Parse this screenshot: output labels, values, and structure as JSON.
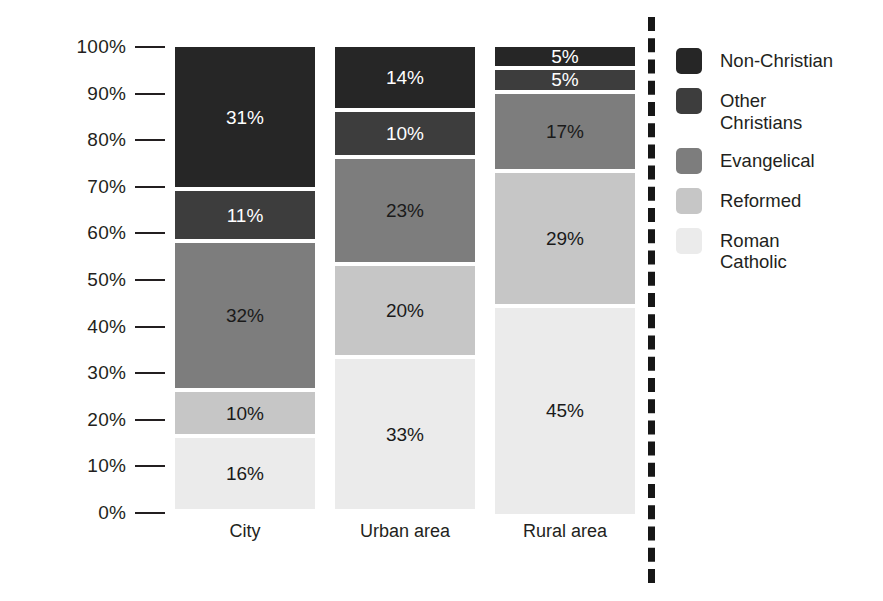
{
  "chart_data": {
    "type": "bar",
    "subtype": "stacked-percentage",
    "title": "",
    "xlabel": "",
    "ylabel": "",
    "ylim": [
      0,
      100
    ],
    "grid": false,
    "legend_position": "right",
    "categories": [
      "City",
      "Urban area",
      "Rural area"
    ],
    "y_ticks": [
      "0%",
      "10%",
      "20%",
      "30%",
      "40%",
      "50%",
      "60%",
      "70%",
      "80%",
      "90%",
      "100%"
    ],
    "series": [
      {
        "name": "Non-Christian",
        "color": "#262626",
        "label_color": "#ffffff",
        "values": [
          31,
          14,
          5
        ]
      },
      {
        "name": "Other\nChristians",
        "legend_name": "Other Christians",
        "color": "#3d3d3d",
        "label_color": "#ffffff",
        "values": [
          11,
          10,
          5
        ]
      },
      {
        "name": "Evangelical",
        "color": "#7d7d7d",
        "label_color": "#1a1a1a",
        "values": [
          32,
          23,
          17
        ]
      },
      {
        "name": "Reformed",
        "color": "#c6c6c6",
        "label_color": "#1a1a1a",
        "values": [
          10,
          20,
          29
        ]
      },
      {
        "name": "Roman\nCatholic",
        "legend_name": "Roman Catholic",
        "color": "#ebebeb",
        "label_color": "#1a1a1a",
        "values": [
          16,
          33,
          45
        ]
      }
    ],
    "bars": [
      {
        "category": "City",
        "segments": [
          {
            "series": "Non-Christian",
            "value": 31,
            "label": "31%"
          },
          {
            "series": "Other Christians",
            "value": 11,
            "label": "11%"
          },
          {
            "series": "Evangelical",
            "value": 32,
            "label": "32%"
          },
          {
            "series": "Reformed",
            "value": 10,
            "label": "10%"
          },
          {
            "series": "Roman Catholic",
            "value": 16,
            "label": "16%"
          }
        ]
      },
      {
        "category": "Urban area",
        "segments": [
          {
            "series": "Non-Christian",
            "value": 14,
            "label": "14%"
          },
          {
            "series": "Other Christians",
            "value": 10,
            "label": "10%"
          },
          {
            "series": "Evangelical",
            "value": 23,
            "label": "23%"
          },
          {
            "series": "Reformed",
            "value": 20,
            "label": "20%"
          },
          {
            "series": "Roman Catholic",
            "value": 33,
            "label": "33%"
          }
        ]
      },
      {
        "category": "Rural area",
        "segments": [
          {
            "series": "Non-Christian",
            "value": 5,
            "label": "5%"
          },
          {
            "series": "Other Christians",
            "value": 5,
            "label": "5%"
          },
          {
            "series": "Evangelical",
            "value": 17,
            "label": "17%"
          },
          {
            "series": "Reformed",
            "value": 29,
            "label": "29%"
          },
          {
            "series": "Roman Catholic",
            "value": 45,
            "label": "45%"
          }
        ]
      }
    ]
  },
  "legend": {
    "items": [
      {
        "label": "Non-Christian",
        "color": "#262626"
      },
      {
        "label": "Other\nChristians",
        "color": "#3d3d3d"
      },
      {
        "label": "Evangelical",
        "color": "#7d7d7d"
      },
      {
        "label": "Reformed",
        "color": "#c6c6c6"
      },
      {
        "label": "Roman\nCatholic",
        "color": "#ebebeb"
      }
    ]
  },
  "divider": {
    "style": "dashed",
    "color": "#171717"
  }
}
